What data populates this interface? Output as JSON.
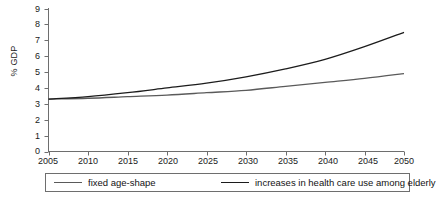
{
  "chart_data": {
    "type": "line",
    "title": "",
    "xlabel": "",
    "ylabel": "% GDP",
    "xlim": [
      2005,
      2050
    ],
    "ylim": [
      0,
      9
    ],
    "grid": false,
    "legend_position": "bottom",
    "x": [
      2005,
      2010,
      2015,
      2020,
      2025,
      2030,
      2035,
      2040,
      2045,
      2050
    ],
    "xticks": [
      "2005",
      "2010",
      "2015",
      "2020",
      "2025",
      "2030",
      "2035",
      "2040",
      "2045",
      "2050"
    ],
    "yticks": [
      "0",
      "1",
      "2",
      "3",
      "4",
      "5",
      "6",
      "7",
      "8",
      "9"
    ],
    "series": [
      {
        "name": "increases in health care use among elderly",
        "color": "#1c1c1c",
        "values": [
          3.3,
          3.45,
          3.7,
          4.0,
          4.3,
          4.7,
          5.2,
          5.8,
          6.6,
          7.5
        ]
      },
      {
        "name": "fixed age-shape",
        "color": "#5a5a5a",
        "values": [
          3.3,
          3.35,
          3.45,
          3.55,
          3.7,
          3.85,
          4.1,
          4.35,
          4.6,
          4.9
        ]
      }
    ]
  },
  "legend": {
    "items": [
      {
        "label": "fixed age-shape",
        "color": "#5a5a5a"
      },
      {
        "label": "increases in health care use among elderly",
        "color": "#1c1c1c"
      }
    ]
  },
  "axes": {
    "y_axis_title": "% GDP"
  }
}
